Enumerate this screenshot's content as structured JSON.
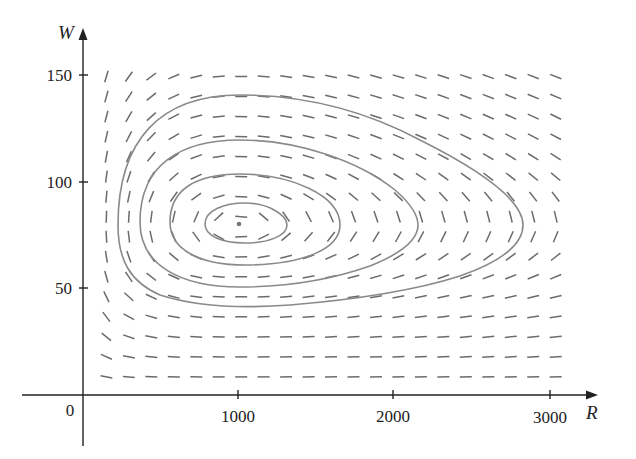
{
  "chart_data": {
    "type": "phase-portrait",
    "title": "",
    "xlabel": "R",
    "ylabel": "W",
    "xlim": [
      0,
      3000
    ],
    "ylim": [
      0,
      150
    ],
    "x_ticks": [
      {
        "value": 1000,
        "label": "1000"
      },
      {
        "value": 2000,
        "label": "2000"
      },
      {
        "value": 3000,
        "label": "3000"
      }
    ],
    "y_ticks": [
      {
        "value": 50,
        "label": "50"
      },
      {
        "value": 100,
        "label": "100"
      },
      {
        "value": 150,
        "label": "150"
      }
    ],
    "origin_label": "0",
    "equilibrium": {
      "R": 1000,
      "W": 80
    },
    "model": {
      "dR_dt": "0.08R - 0.001RW",
      "dW_dt": "-0.02W + 0.00002RW",
      "a": 0.08,
      "b": 0.001,
      "c": 0.02,
      "d": 2e-05
    },
    "direction_field": {
      "R_start": 150,
      "R_step": 144,
      "columns": 21,
      "W_start": 8.5,
      "W_step": 9.4,
      "rows": 16
    },
    "orbits": [
      {
        "name": "orbit-1",
        "R_range": [
          790,
          1310
        ],
        "W_range": [
          71,
          90
        ]
      },
      {
        "name": "orbit-2",
        "R_range": [
          570,
          1650
        ],
        "W_range": [
          60,
          103
        ]
      },
      {
        "name": "orbit-3",
        "R_range": [
          370,
          2150
        ],
        "W_range": [
          50,
          119
        ]
      },
      {
        "name": "orbit-4",
        "R_range": [
          230,
          2830
        ],
        "W_range": [
          41,
          140
        ]
      }
    ],
    "grid": false,
    "legend": null
  },
  "colors": {
    "axis": "#222222",
    "field": "#6b6b6b",
    "orbit": "#8a8a8a",
    "equilibrium": "#777777"
  }
}
